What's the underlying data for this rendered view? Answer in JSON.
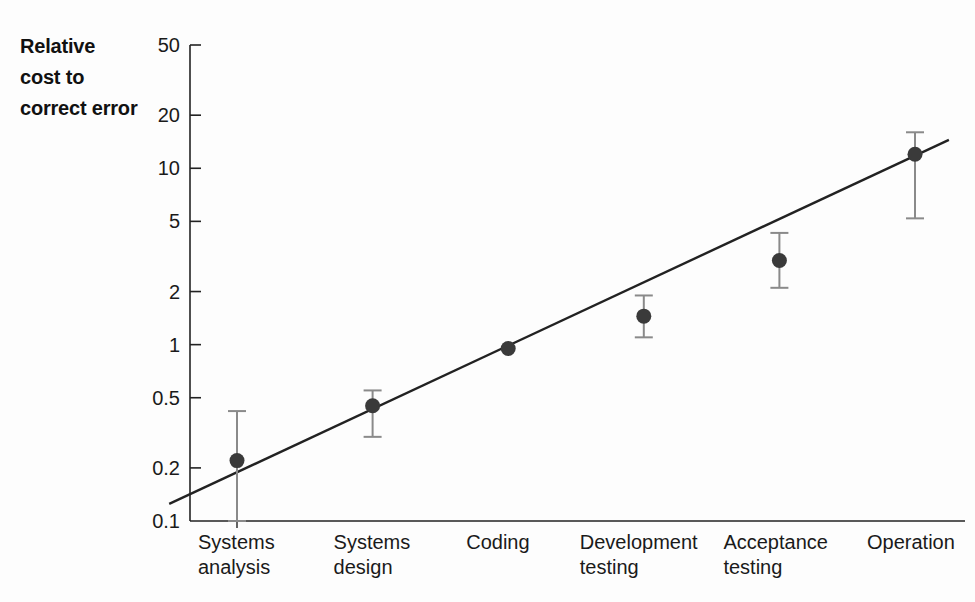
{
  "figure": {
    "background_color": "#fdfdfd",
    "ink_color": "#222222",
    "marker_color": "#3a3a3a",
    "errorbar_color": "#8a8a8a"
  },
  "axis_title": {
    "line1": "Relative",
    "line2": "cost to",
    "line3": "correct error"
  },
  "chart_data": {
    "type": "scatter",
    "title": "",
    "subtitle": "",
    "xlabel": "",
    "ylabel": "Relative cost to correct error",
    "yscale": "log",
    "ylim": [
      0.1,
      50
    ],
    "grid": false,
    "legend": null,
    "categories": [
      "Systems analysis",
      "Systems design",
      "Coding",
      "Development testing",
      "Acceptance testing",
      "Operation"
    ],
    "category_lines": [
      [
        "Systems",
        "analysis"
      ],
      [
        "Systems",
        "design"
      ],
      [
        "Coding",
        ""
      ],
      [
        "Development",
        "testing"
      ],
      [
        "Acceptance",
        "testing"
      ],
      [
        "Operation",
        ""
      ]
    ],
    "ytick_labels": [
      "50",
      "20",
      "10",
      "5",
      "2",
      "1",
      "0.5",
      "0.2",
      "0.1"
    ],
    "ytick_values": [
      50,
      20,
      10,
      5,
      2,
      1,
      0.5,
      0.2,
      0.1
    ],
    "values": [
      0.22,
      0.45,
      0.95,
      1.45,
      3.0,
      12.0
    ],
    "error_low": [
      0.1,
      0.3,
      null,
      1.1,
      2.1,
      5.2
    ],
    "error_high": [
      0.42,
      0.55,
      null,
      1.9,
      4.3,
      16.0
    ],
    "trend_line": {
      "label": "fitted trend line",
      "x_start_category_index": -0.5,
      "x_end_category_index": 5.25,
      "y_start": 0.125,
      "y_end": 14.5
    }
  }
}
